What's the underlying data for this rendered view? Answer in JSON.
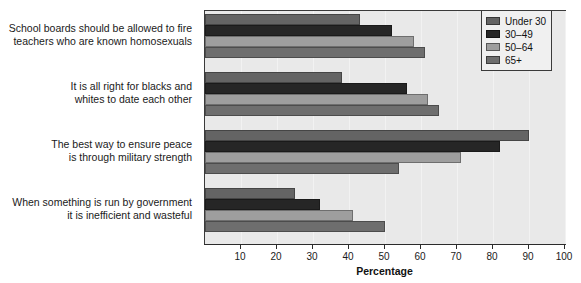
{
  "chart_data": {
    "type": "bar",
    "orientation": "horizontal",
    "title": "",
    "xlabel": "Percentage",
    "ylabel": "",
    "xlim": [
      0,
      100
    ],
    "xticks": [
      10,
      20,
      30,
      40,
      50,
      60,
      70,
      80,
      90,
      100
    ],
    "grid": true,
    "legend_position": "top-right",
    "categories": [
      "School boards should be allowed to fire\nteachers who are known homosexuals",
      "It is all right for blacks and\nwhites to date each other",
      "The best way to ensure peace\nis through military strength",
      "When something is run by government\nit is inefficient and wasteful"
    ],
    "series": [
      {
        "name": "Under 30",
        "color": "#646464",
        "values": [
          43,
          38,
          90,
          25
        ]
      },
      {
        "name": "30–49",
        "color": "#262626",
        "values": [
          52,
          56,
          82,
          32
        ]
      },
      {
        "name": "50–64",
        "color": "#9e9e9e",
        "values": [
          58,
          62,
          71,
          41
        ]
      },
      {
        "name": "65+",
        "color": "#6e6e6e",
        "values": [
          61,
          65,
          54,
          50
        ]
      }
    ]
  },
  "legend": {
    "items": [
      {
        "label": "Under 30",
        "color": "#646464"
      },
      {
        "label": "30–49",
        "color": "#262626"
      },
      {
        "label": "50–64",
        "color": "#9e9e9e"
      },
      {
        "label": "65+",
        "color": "#6e6e6e"
      }
    ]
  },
  "axis": {
    "title": "Percentage",
    "ticks": [
      "10",
      "20",
      "30",
      "40",
      "50",
      "60",
      "70",
      "80",
      "90",
      "100"
    ]
  },
  "colors": {
    "plot_background": "#e9e9e9",
    "plot_border": "#3a3a3a",
    "page_background": "#ffffff",
    "text": "#111111"
  }
}
